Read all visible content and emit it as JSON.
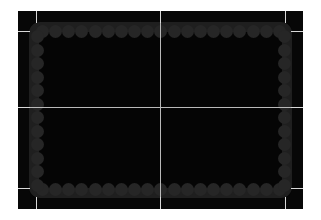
{
  "view": {
    "title": "Simulation Arena",
    "background_color": "#ffffff",
    "plate_color": "#070707",
    "playfield_color": "#050505",
    "rail_color": "#1f1f1f",
    "bumper_color": "#262626",
    "gridline_color": "#b9b9b9",
    "tick_color": "#d8d8d8",
    "width": 321,
    "height": 220
  },
  "playfield": {
    "left": 29,
    "top": 22,
    "width": 263,
    "height": 176,
    "corner_radius": 9
  },
  "crosshair": {
    "center_x": 160,
    "center_y": 107,
    "vertical_label": "",
    "horizontal_label": ""
  },
  "bumpers": {
    "diameter": 13,
    "top_count": 19,
    "bottom_count": 19,
    "left_count": 12,
    "right_count": 12
  },
  "ticks": {
    "top": [
      "",
      "",
      ""
    ],
    "bottom": [
      "",
      "",
      ""
    ],
    "left": [
      "",
      "",
      ""
    ],
    "right": [
      "",
      "",
      ""
    ]
  }
}
